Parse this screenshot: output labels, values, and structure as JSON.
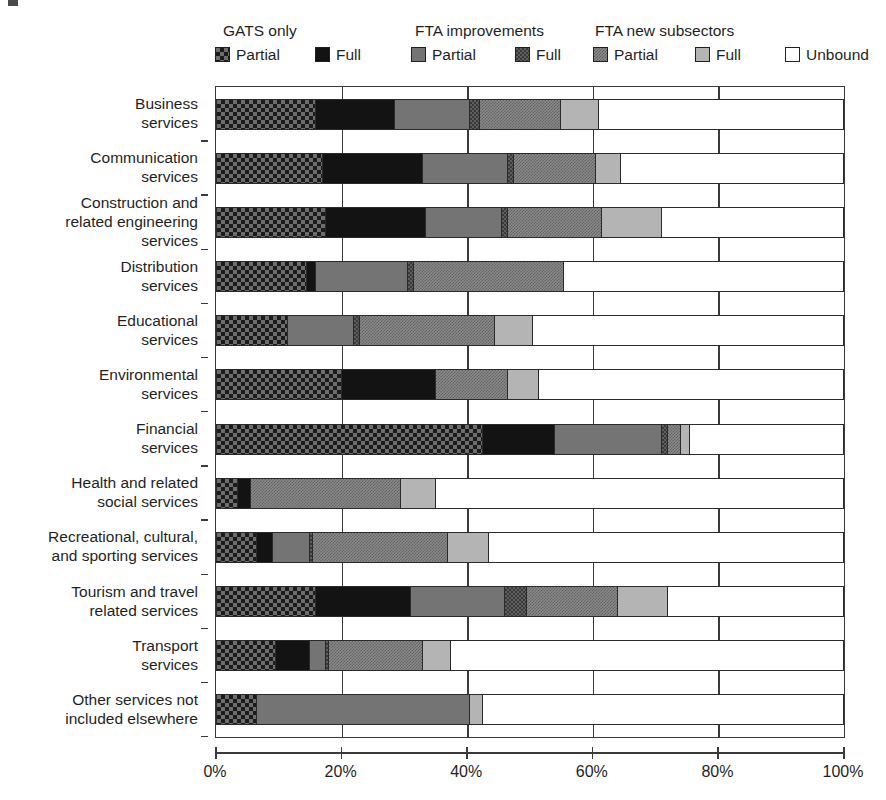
{
  "legend": {
    "groups": [
      {
        "title": "GATS only"
      },
      {
        "title": "FTA improvements"
      },
      {
        "title": "FTA new subsectors"
      }
    ],
    "items": [
      {
        "label": "Partial",
        "icon": "gats-partial-swatch"
      },
      {
        "label": "Full",
        "icon": "gats-full-swatch"
      },
      {
        "label": "Partial",
        "icon": "fta-improvements-partial-swatch"
      },
      {
        "label": "Full",
        "icon": "fta-improvements-full-swatch"
      },
      {
        "label": "Partial",
        "icon": "fta-new-subsectors-partial-swatch"
      },
      {
        "label": "Full",
        "icon": "fta-new-subsectors-full-swatch"
      },
      {
        "label": "Unbound",
        "icon": "unbound-swatch"
      }
    ]
  },
  "chart_data": {
    "type": "bar",
    "orientation": "horizontal",
    "stacked": true,
    "title": "",
    "xlabel": "",
    "ylabel": "",
    "xlim": [
      0,
      100
    ],
    "xticks": [
      0,
      20,
      40,
      60,
      80,
      100
    ],
    "xtick_labels": [
      "0%",
      "20%",
      "40%",
      "60%",
      "80%",
      "100%"
    ],
    "grid": true,
    "legend_position": "top",
    "categories": [
      "Business services",
      "Communication services",
      "Construction and related engineering services",
      "Distribution services",
      "Educational services",
      "Environmental services",
      "Financial services",
      "Health and related social services",
      "Recreational, cultural, and sporting services",
      "Tourism and travel related services",
      "Transport services",
      "Other services not included elsewhere"
    ],
    "category_lines": [
      [
        "Business",
        "services"
      ],
      [
        "Communication",
        "services"
      ],
      [
        "Construction and",
        "related engineering",
        "services"
      ],
      [
        "Distribution",
        "services"
      ],
      [
        "Educational",
        "services"
      ],
      [
        "Environmental",
        "services"
      ],
      [
        "Financial",
        "services"
      ],
      [
        "Health and related",
        "social services"
      ],
      [
        "Recreational, cultural,",
        "and sporting services"
      ],
      [
        "Tourism and travel",
        "related services"
      ],
      [
        "Transport",
        "services"
      ],
      [
        "Other services not",
        "included elsewhere"
      ]
    ],
    "series": [
      {
        "name": "GATS only Partial",
        "key": "gats_partial",
        "values": [
          16.0,
          17.0,
          17.5,
          14.5,
          11.5,
          20.0,
          42.5,
          3.5,
          6.5,
          16.0,
          9.5,
          6.5
        ]
      },
      {
        "name": "GATS only Full",
        "key": "gats_full",
        "values": [
          12.5,
          16.0,
          16.0,
          1.5,
          0.0,
          15.0,
          11.5,
          2.0,
          2.5,
          15.0,
          5.5,
          0.0
        ]
      },
      {
        "name": "FTA improvements Partial",
        "key": "fta_improvements_partial",
        "values": [
          12.0,
          13.5,
          12.0,
          14.5,
          10.5,
          0.0,
          17.0,
          0.0,
          6.0,
          15.0,
          2.5,
          34.0
        ]
      },
      {
        "name": "FTA improvements Full",
        "key": "fta_improvements_full",
        "values": [
          1.5,
          1.0,
          1.0,
          1.0,
          1.0,
          0.0,
          1.0,
          0.0,
          0.5,
          3.5,
          0.5,
          0.0
        ]
      },
      {
        "name": "FTA new subsectors Partial",
        "key": "fta_new_partial",
        "values": [
          13.0,
          13.0,
          15.0,
          24.0,
          21.5,
          11.5,
          2.0,
          24.0,
          21.5,
          14.5,
          15.0,
          0.0
        ]
      },
      {
        "name": "FTA new subsectors Full",
        "key": "fta_new_full",
        "values": [
          6.0,
          4.0,
          9.5,
          0.0,
          6.0,
          5.0,
          1.5,
          5.5,
          6.5,
          8.0,
          4.5,
          2.0
        ]
      },
      {
        "name": "Unbound",
        "key": "unbound",
        "values": [
          39.0,
          35.5,
          29.0,
          44.5,
          49.5,
          48.5,
          24.5,
          65.0,
          56.5,
          28.0,
          62.5,
          57.5
        ]
      }
    ]
  }
}
